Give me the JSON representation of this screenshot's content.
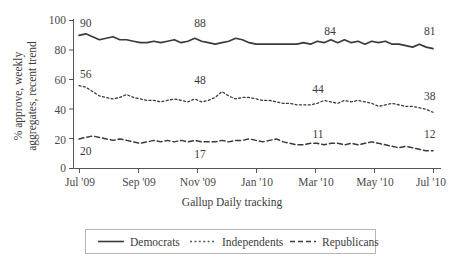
{
  "chart_data": {
    "type": "line",
    "title": "",
    "xlabel": "Gallup Daily tracking",
    "ylabel_line1": "% approve, weekly",
    "ylabel_line2": "aggregates, recent trend",
    "ylim": [
      0,
      100
    ],
    "yticks": [
      0,
      20,
      40,
      60,
      80,
      100
    ],
    "ytick_labels": [
      "0",
      "20",
      "40",
      "60",
      "80",
      "100"
    ],
    "xtick_labels": [
      "Jul '09",
      "Sep '09",
      "Nov '09",
      "Jan '10",
      "Mar '10",
      "May '10",
      "Jul '10"
    ],
    "grid": false,
    "legend_position": "below",
    "x_index": [
      0,
      1,
      2,
      3,
      4,
      5,
      6,
      7,
      8,
      9,
      10,
      11,
      12,
      13,
      14,
      15,
      16,
      17,
      18,
      19,
      20,
      21,
      22,
      23,
      24,
      25,
      26,
      27,
      28,
      29,
      30,
      31,
      32,
      33,
      34,
      35,
      36,
      37,
      38,
      39,
      40,
      41,
      42,
      43,
      44,
      45,
      46,
      47,
      48,
      49,
      50,
      51,
      52
    ],
    "series": [
      {
        "name": "Democrats",
        "style": "solid",
        "color": "#3a3a3a",
        "values": [
          90,
          91,
          89,
          87,
          88,
          89,
          87,
          87,
          86,
          85,
          85,
          86,
          85,
          86,
          87,
          85,
          86,
          88,
          86,
          85,
          84,
          85,
          86,
          88,
          87,
          85,
          84,
          84,
          84,
          84,
          84,
          84,
          84,
          85,
          84,
          86,
          85,
          87,
          85,
          87,
          85,
          86,
          84,
          86,
          85,
          86,
          84,
          84,
          83,
          82,
          84,
          82,
          81
        ],
        "start_label": "90",
        "mid_label": "88",
        "late_label": "84",
        "end_label": "81"
      },
      {
        "name": "Independents",
        "style": "dotted",
        "color": "#5a5a5a",
        "values": [
          56,
          55,
          52,
          49,
          48,
          47,
          48,
          50,
          48,
          47,
          46,
          46,
          45,
          46,
          47,
          46,
          45,
          47,
          45,
          46,
          48,
          52,
          49,
          47,
          48,
          48,
          47,
          46,
          46,
          45,
          44,
          44,
          43,
          43,
          43,
          44,
          46,
          45,
          44,
          46,
          45,
          46,
          45,
          44,
          42,
          43,
          44,
          43,
          42,
          42,
          41,
          40,
          38
        ],
        "start_label": "56",
        "mid_label": "48",
        "late_label": "44",
        "end_label": "38"
      },
      {
        "name": "Republicans",
        "style": "dashed",
        "color": "#3a3a3a",
        "values": [
          20,
          21,
          22,
          21,
          20,
          19,
          20,
          19,
          18,
          17,
          18,
          19,
          18,
          19,
          18,
          19,
          18,
          19,
          18,
          18,
          18,
          19,
          18,
          19,
          19,
          20,
          19,
          18,
          19,
          20,
          18,
          17,
          16,
          16,
          17,
          17,
          16,
          17,
          17,
          16,
          17,
          16,
          17,
          18,
          17,
          16,
          15,
          14,
          15,
          14,
          13,
          12,
          12
        ],
        "start_label": "20",
        "mid_label": "17",
        "late_label": "11",
        "end_label": "12"
      }
    ],
    "annotations": [
      {
        "text": "90",
        "series": "Democrats",
        "position": "start"
      },
      {
        "text": "88",
        "series": "Democrats",
        "position": "middle"
      },
      {
        "text": "84",
        "series": "Democrats",
        "position": "late"
      },
      {
        "text": "81",
        "series": "Democrats",
        "position": "end"
      },
      {
        "text": "56",
        "series": "Independents",
        "position": "start"
      },
      {
        "text": "48",
        "series": "Independents",
        "position": "middle"
      },
      {
        "text": "44",
        "series": "Independents",
        "position": "late"
      },
      {
        "text": "38",
        "series": "Independents",
        "position": "end"
      },
      {
        "text": "20",
        "series": "Republicans",
        "position": "start"
      },
      {
        "text": "17",
        "series": "Republicans",
        "position": "middle"
      },
      {
        "text": "11",
        "series": "Republicans",
        "position": "late"
      },
      {
        "text": "12",
        "series": "Republicans",
        "position": "end"
      }
    ]
  },
  "legend": {
    "items": [
      {
        "label": "Democrats",
        "style": "solid"
      },
      {
        "label": "Independents",
        "style": "dotted"
      },
      {
        "label": "Republicans",
        "style": "dashed"
      }
    ]
  }
}
